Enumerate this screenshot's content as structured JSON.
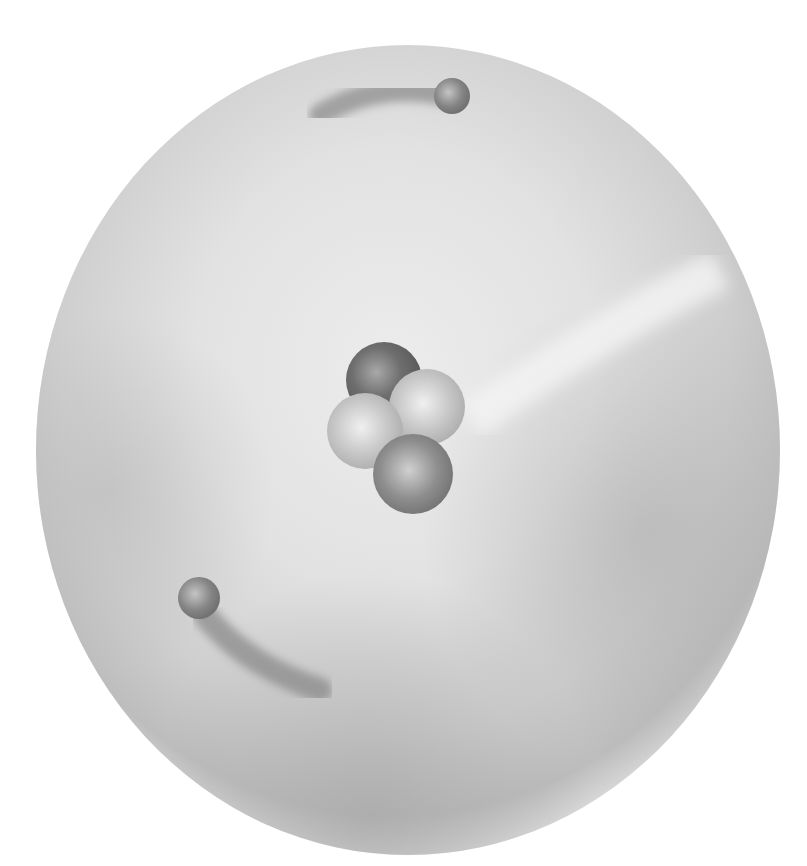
{
  "illustration": {
    "subject": "atom",
    "nucleus": {
      "particle_count": 4
    },
    "electrons": {
      "count": 2
    },
    "colors": {
      "background": "#ffffff",
      "cloud_light": "#eeeeee",
      "cloud_mid": "#c8c8c8",
      "cloud_dark": "#a8a8a8",
      "particle_dark": "#6a6a6a",
      "particle_light": "#bdbdbd",
      "electron": "#8a8a8a"
    }
  }
}
